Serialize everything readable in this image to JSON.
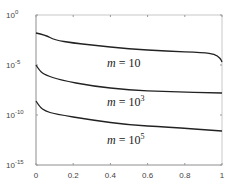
{
  "chart_data": {
    "type": "line",
    "title": "",
    "xlabel": "",
    "ylabel": "",
    "xlim": [
      0,
      1
    ],
    "ylim_log10": [
      -15,
      0
    ],
    "yscale": "log",
    "grid": false,
    "legend": "none (inline curve annotations)",
    "x_ticks": [
      "0",
      "0.2",
      "0.4",
      "0.6",
      "0.8",
      "1"
    ],
    "y_ticks": [
      {
        "base": "10",
        "exp": "0"
      },
      {
        "base": "10",
        "exp": "-5"
      },
      {
        "base": "10",
        "exp": "-10"
      },
      {
        "base": "10",
        "exp": "-15"
      }
    ],
    "series": [
      {
        "name": "m = 10",
        "label_text": "m",
        "label_eq": "= 10",
        "label_exp": "",
        "x": [
          0.0,
          0.05,
          0.1,
          0.2,
          0.3,
          0.5,
          0.7,
          0.9,
          0.96,
          0.99,
          1.0
        ],
        "log10_y": [
          -1.8,
          -2.0,
          -2.5,
          -2.8,
          -3.0,
          -3.4,
          -3.6,
          -3.75,
          -3.9,
          -4.3,
          -4.7
        ]
      },
      {
        "name": "m = 10^3",
        "label_text": "m",
        "label_eq": "= 10",
        "label_exp": "3",
        "x": [
          0.0,
          0.02,
          0.05,
          0.13,
          0.3,
          0.5,
          0.7,
          1.0
        ],
        "log10_y": [
          -5.0,
          -5.6,
          -6.0,
          -6.5,
          -7.1,
          -7.5,
          -7.65,
          -7.8
        ]
      },
      {
        "name": "m = 10^5",
        "label_text": "m",
        "label_eq": "= 10",
        "label_exp": "5",
        "x": [
          0.0,
          0.02,
          0.05,
          0.1,
          0.3,
          0.5,
          0.7,
          1.0
        ],
        "log10_y": [
          -8.6,
          -9.2,
          -9.6,
          -9.9,
          -10.5,
          -11.0,
          -11.2,
          -11.6
        ]
      }
    ]
  }
}
